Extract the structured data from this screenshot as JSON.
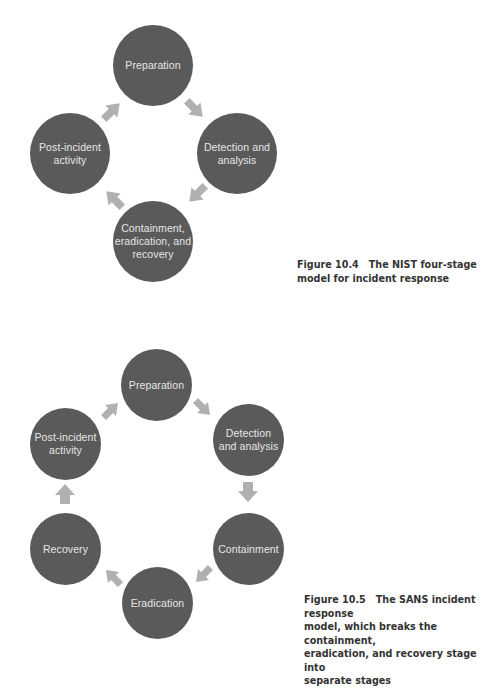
{
  "colors": {
    "circle_fill": "#5a5a5a",
    "circle_text": "#e6e6e6",
    "arrow_fill": "#b0b0b0",
    "caption_text": "#333333",
    "background": "#ffffff"
  },
  "figure_10_4": {
    "stages": [
      {
        "label_lines": [
          "Preparation"
        ]
      },
      {
        "label_lines": [
          "Detection and",
          "analysis"
        ]
      },
      {
        "label_lines": [
          "Containment,",
          "eradication, and",
          "recovery"
        ]
      },
      {
        "label_lines": [
          "Post-incident",
          "activity"
        ]
      }
    ],
    "arrows": [
      "arrow-down-right",
      "arrow-down-left",
      "arrow-up-left",
      "arrow-up-right"
    ],
    "caption": {
      "number": "Figure 10.4",
      "line1": "The NIST four-stage",
      "line2": "model for incident response"
    }
  },
  "figure_10_5": {
    "stages": [
      {
        "label_lines": [
          "Preparation"
        ]
      },
      {
        "label_lines": [
          "Detection",
          "and analysis"
        ]
      },
      {
        "label_lines": [
          "Containment"
        ]
      },
      {
        "label_lines": [
          "Eradication"
        ]
      },
      {
        "label_lines": [
          "Recovery"
        ]
      },
      {
        "label_lines": [
          "Post-incident",
          "activity"
        ]
      }
    ],
    "arrows": [
      "arrow-down-right",
      "arrow-down",
      "arrow-down-left",
      "arrow-up-left",
      "arrow-up",
      "arrow-up-right"
    ],
    "caption": {
      "number": "Figure 10.5",
      "line1": "The SANS incident response",
      "line2": "model, which breaks the containment,",
      "line3": "eradication, and recovery stage into",
      "line4": "separate stages"
    }
  }
}
